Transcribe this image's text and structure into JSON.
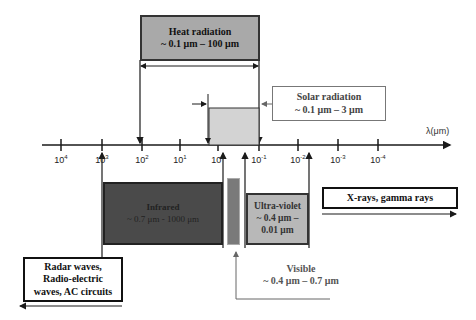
{
  "diagram": {
    "axis": {
      "label": "λ(μm)",
      "ticks": [
        {
          "base": "10",
          "exp": "4"
        },
        {
          "base": "10",
          "exp": "3"
        },
        {
          "base": "10",
          "exp": "2"
        },
        {
          "base": "10",
          "exp": "1"
        },
        {
          "base": "10",
          "exp": "0"
        },
        {
          "base": "10",
          "exp": "-1"
        },
        {
          "base": "10",
          "exp": "-2"
        },
        {
          "base": "10",
          "exp": "-3"
        },
        {
          "base": "10",
          "exp": "-4"
        }
      ]
    },
    "heat_radiation": {
      "title": "Heat radiation",
      "range": "~ 0.1 μm – 100 μm"
    },
    "solar_radiation": {
      "title": "Solar radiation",
      "range": "~ 0.1 μm – 3 μm"
    },
    "infrared": {
      "title": "Infrared",
      "range": "~ 0.7 μm - 1000 μm"
    },
    "ultraviolet": {
      "title": "Ultra-violet",
      "range_line1": "~ 0.4 μm –",
      "range_line2": "0.01 μm"
    },
    "xrays": {
      "title": "X-rays, gamma rays"
    },
    "radar": {
      "line1": "Radar waves,",
      "line2": "Radio-electric",
      "line3": "waves, AC circuits"
    },
    "visible": {
      "title": "Visible",
      "range": "~ 0.4 μm – 0.7 μm"
    },
    "colors": {
      "heat_fill": "#a9a9a9",
      "solar_fill": "#d3d3d3",
      "infrared_fill": "#4a4a4a",
      "visible_fill": "#7a7a7a",
      "ultraviolet_fill": "#b8b8b8",
      "line": "#1a1a1a"
    }
  }
}
